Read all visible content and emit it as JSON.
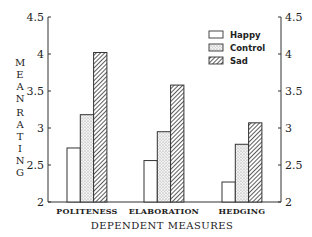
{
  "chart_data": {
    "type": "bar",
    "title": "",
    "xlabel": "DEPENDENT MEASURES",
    "ylabel": "MEAN RATING",
    "ylim": [
      2,
      4.5
    ],
    "yticks": [
      2,
      2.5,
      3,
      3.5,
      4,
      4.5
    ],
    "ytick_labels": [
      "2",
      "2.5",
      "3",
      "3.5",
      "4",
      "4.5"
    ],
    "secondary_y_axis": true,
    "grid": false,
    "legend_position": "upper right",
    "categories": [
      "POLITENESS",
      "ELABORATION",
      "HEDGING"
    ],
    "series": [
      {
        "name": "Happy",
        "pattern": "blank",
        "values": [
          2.73,
          2.56,
          2.27
        ]
      },
      {
        "name": "Control",
        "pattern": "dotted",
        "values": [
          3.18,
          2.95,
          2.78
        ]
      },
      {
        "name": "Sad",
        "pattern": "hatched",
        "values": [
          4.02,
          3.58,
          3.07
        ]
      }
    ]
  },
  "axes": {
    "ylabel_letters_top": [
      "M",
      "E",
      "A",
      "N"
    ],
    "ylabel_letters_bottom": [
      "R",
      "A",
      "T",
      "I",
      "N",
      "G"
    ]
  }
}
